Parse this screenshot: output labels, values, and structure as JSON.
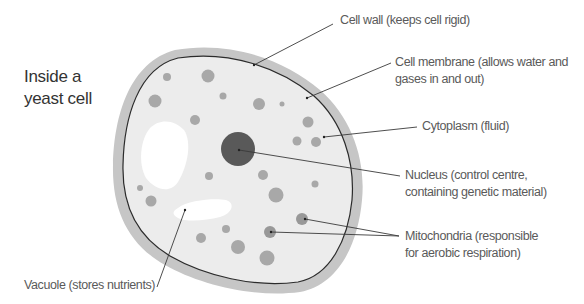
{
  "title": {
    "line1": "Inside a",
    "line2": "yeast cell"
  },
  "colors": {
    "cell_wall": "#c6c6c6",
    "cytoplasm": "#ececec",
    "membrane": "#2b2b2b",
    "organelle": "#a8a8a8",
    "nucleus": "#595959",
    "vacuole": "#ffffff",
    "leader_line": "#3a3a3a",
    "label_text": "#5a5a5a"
  },
  "labels": {
    "cell_wall": {
      "line1": "Cell wall (keeps cell rigid)"
    },
    "cell_membrane": {
      "line1": "Cell membrane (allows water and",
      "line2": "gases in and out)"
    },
    "cytoplasm": {
      "line1": "Cytoplasm (fluid)"
    },
    "nucleus": {
      "line1": "Nucleus (control centre,",
      "line2": "containing genetic material)"
    },
    "mitochondria": {
      "line1": "Mitochondria (responsible",
      "line2": "for aerobic respiration)"
    },
    "vacuole": {
      "line1": "Vacuole (stores nutrients)"
    }
  }
}
